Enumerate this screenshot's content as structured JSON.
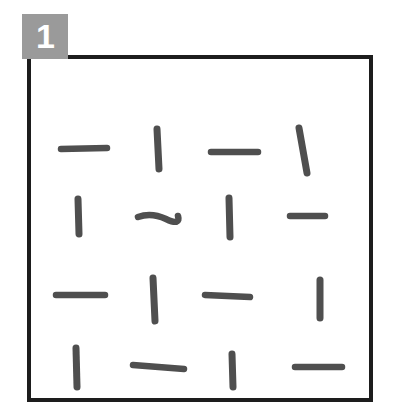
{
  "figure": {
    "panel_label": "1",
    "badge_color": "#9a9a9a",
    "badge_text_color": "#ffffff",
    "frame_color": "#1d1d1d",
    "background_color": "#ffffff",
    "stroke_color": "#4f4f4f"
  },
  "chart_data": {
    "type": "scatter",
    "title": "",
    "subtitle": "",
    "xlabel": "",
    "ylabel": "",
    "grid": false,
    "legend": null,
    "rows": 4,
    "columns": 4,
    "orientation_grid": [
      [
        "horizontal",
        "vertical",
        "horizontal",
        "vertical"
      ],
      [
        "vertical",
        "horizontal",
        "vertical",
        "horizontal"
      ],
      [
        "horizontal",
        "vertical",
        "horizontal",
        "vertical"
      ],
      [
        "vertical",
        "horizontal",
        "vertical",
        "horizontal"
      ]
    ],
    "counts": {
      "horizontal": 8,
      "vertical": 8,
      "total": 16
    },
    "elements": [
      {
        "row": 1,
        "col": 1,
        "orientation": "horizontal",
        "x1": 30,
        "y1": 90,
        "x2": 76,
        "y2": 89,
        "tilt": -2,
        "wavy": false
      },
      {
        "row": 1,
        "col": 2,
        "orientation": "vertical",
        "x1": 126,
        "y1": 70,
        "x2": 128,
        "y2": 110,
        "tilt": 1,
        "wavy": false
      },
      {
        "row": 1,
        "col": 3,
        "orientation": "horizontal",
        "x1": 180,
        "y1": 93,
        "x2": 227,
        "y2": 93,
        "tilt": 0,
        "wavy": false
      },
      {
        "row": 1,
        "col": 4,
        "orientation": "vertical",
        "x1": 268,
        "y1": 69,
        "x2": 276,
        "y2": 114,
        "tilt": 7,
        "wavy": false
      },
      {
        "row": 2,
        "col": 1,
        "orientation": "vertical",
        "x1": 47,
        "y1": 140,
        "x2": 48,
        "y2": 175,
        "tilt": 1,
        "wavy": false
      },
      {
        "row": 2,
        "col": 2,
        "orientation": "horizontal",
        "x1": 107,
        "y1": 157,
        "x2": 147,
        "y2": 158,
        "tilt": 0,
        "wavy": true
      },
      {
        "row": 2,
        "col": 3,
        "orientation": "vertical",
        "x1": 198,
        "y1": 139,
        "x2": 199,
        "y2": 178,
        "tilt": 1,
        "wavy": false
      },
      {
        "row": 2,
        "col": 4,
        "orientation": "horizontal",
        "x1": 259,
        "y1": 157,
        "x2": 294,
        "y2": 157,
        "tilt": -1,
        "wavy": false
      },
      {
        "row": 3,
        "col": 1,
        "orientation": "horizontal",
        "x1": 25,
        "y1": 236,
        "x2": 74,
        "y2": 236,
        "tilt": 0,
        "wavy": false
      },
      {
        "row": 3,
        "col": 2,
        "orientation": "vertical",
        "x1": 122,
        "y1": 219,
        "x2": 124,
        "y2": 262,
        "tilt": 1,
        "wavy": false
      },
      {
        "row": 3,
        "col": 3,
        "orientation": "horizontal",
        "x1": 174,
        "y1": 236,
        "x2": 219,
        "y2": 238,
        "tilt": 1,
        "wavy": false
      },
      {
        "row": 3,
        "col": 4,
        "orientation": "vertical",
        "x1": 289,
        "y1": 221,
        "x2": 289,
        "y2": 259,
        "tilt": 0,
        "wavy": false
      },
      {
        "row": 4,
        "col": 1,
        "orientation": "vertical",
        "x1": 45,
        "y1": 289,
        "x2": 46,
        "y2": 328,
        "tilt": 1,
        "wavy": false
      },
      {
        "row": 4,
        "col": 2,
        "orientation": "horizontal",
        "x1": 102,
        "y1": 306,
        "x2": 153,
        "y2": 310,
        "tilt": 2,
        "wavy": false
      },
      {
        "row": 4,
        "col": 3,
        "orientation": "vertical",
        "x1": 201,
        "y1": 295,
        "x2": 202,
        "y2": 328,
        "tilt": 1,
        "wavy": false
      },
      {
        "row": 4,
        "col": 4,
        "orientation": "horizontal",
        "x1": 264,
        "y1": 308,
        "x2": 311,
        "y2": 308,
        "tilt": 0,
        "wavy": false
      }
    ]
  }
}
